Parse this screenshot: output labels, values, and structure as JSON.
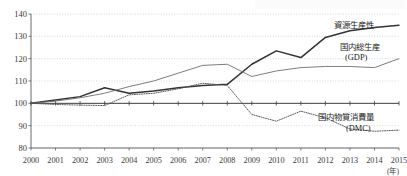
{
  "chart_data": {
    "type": "line",
    "title": "",
    "xlabel": "(年)",
    "ylabel": "",
    "x": [
      2000,
      2001,
      2002,
      2003,
      2004,
      2005,
      2006,
      2007,
      2008,
      2009,
      2010,
      2011,
      2012,
      2013,
      2014,
      2015
    ],
    "xlim": [
      2000,
      2015
    ],
    "ylim": [
      80,
      140
    ],
    "yticks": [
      80,
      90,
      100,
      110,
      120,
      130,
      140
    ],
    "xticks": [
      "2000",
      "2001",
      "2002",
      "2003",
      "2004",
      "2005",
      "2006",
      "2007",
      "2008",
      "2009",
      "2010",
      "2011",
      "2012",
      "2013",
      "2014",
      "2015"
    ],
    "grid": true,
    "legend_position": "right-inline",
    "baseline_value": 100,
    "series": [
      {
        "name": "資源生産性",
        "label_line1": "資源生産性",
        "label_line2": "",
        "style": "solid-thick",
        "color": "#333333",
        "values": [
          100.0,
          101.5,
          103.0,
          107.0,
          104.5,
          105.5,
          107.0,
          108.0,
          108.5,
          117.5,
          123.5,
          120.5,
          129.5,
          132.5,
          134.0,
          135.0
        ]
      },
      {
        "name": "国内総生産(GDP)",
        "label_line1": "国内総生産",
        "label_line2": "(GDP)",
        "style": "solid-thin",
        "color": "#6e6e6e",
        "values": [
          100.0,
          101.0,
          102.5,
          104.5,
          107.5,
          110.0,
          113.5,
          117.0,
          117.5,
          112.0,
          114.5,
          116.0,
          116.5,
          116.5,
          116.0,
          120.0
        ]
      },
      {
        "name": "国内物質消費量(DMC)",
        "label_line1": "国内物質消費量",
        "label_line2": "(DMC)",
        "style": "dotted",
        "color": "#555555",
        "values": [
          100.0,
          99.5,
          99.2,
          99.0,
          103.8,
          104.5,
          106.5,
          109.0,
          108.0,
          95.0,
          92.0,
          96.5,
          93.5,
          88.5,
          87.5,
          88.0
        ]
      }
    ],
    "annotations": {
      "unit_year": "(年)"
    }
  },
  "axis": {
    "y_labels": [
      "140",
      "130",
      "120",
      "110",
      "100",
      "90",
      "80"
    ],
    "x_labels": [
      "2000",
      "2001",
      "2002",
      "2003",
      "2004",
      "2005",
      "2006",
      "2007",
      "2008",
      "2009",
      "2010",
      "2011",
      "2012",
      "2013",
      "2014",
      "2015"
    ],
    "x_unit": "(年)"
  },
  "legend": {
    "items": [
      {
        "line1": "資源生産性",
        "line2": ""
      },
      {
        "line1": "国内総生産",
        "line2": "(GDP)"
      },
      {
        "line1": "国内物質消費量",
        "line2": "(DMC)"
      }
    ]
  }
}
